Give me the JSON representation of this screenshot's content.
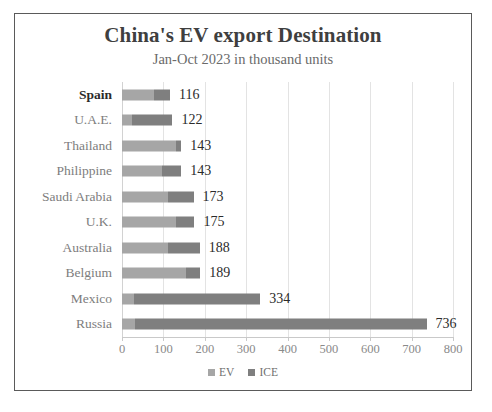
{
  "chart_data": {
    "type": "bar",
    "orientation": "horizontal",
    "stacked": true,
    "title": "China's EV export Destination",
    "subtitle": "Jan-Oct 2023 in thousand units",
    "xlabel": "",
    "ylabel": "",
    "xlim": [
      0,
      800
    ],
    "xticks": [
      0,
      100,
      200,
      300,
      400,
      500,
      600,
      700,
      800
    ],
    "xtick_labels": [
      "0",
      "100",
      "200",
      "300",
      "400",
      "500",
      "600",
      "700",
      "800"
    ],
    "grid": true,
    "legend_position": "bottom",
    "categories": [
      "Spain",
      "U.A.E.",
      "Thailand",
      "Philippine",
      "Saudi Arabia",
      "U.K.",
      "Australia",
      "Belgium",
      "Mexico",
      "Russia"
    ],
    "series": [
      {
        "name": "EV",
        "color": "#a6a6a6",
        "values": [
          78,
          23,
          131,
          96,
          111,
          130,
          110,
          155,
          28,
          32
        ]
      },
      {
        "name": "ICE",
        "color": "#7f7f7f",
        "values": [
          38,
          99,
          12,
          47,
          62,
          45,
          78,
          34,
          306,
          704
        ]
      }
    ],
    "totals": [
      116,
      122,
      143,
      143,
      173,
      175,
      188,
      189,
      334,
      736
    ],
    "total_labels": [
      "116",
      "122",
      "143",
      "143",
      "173",
      "175",
      "188",
      "189",
      "334",
      "736"
    ],
    "highlight_category": "Spain",
    "colors": {
      "ev": "#a6a6a6",
      "ice": "#7f7f7f",
      "title": "#3f3f3f",
      "subtitle": "#6a6a6a",
      "category_label": "#7d7d7d",
      "value_label": "#2b2b2b",
      "tick_label": "#8a8a8a",
      "grid": "#e3e3e3",
      "frame": "#5a5a5a",
      "background": "#ffffff"
    }
  }
}
